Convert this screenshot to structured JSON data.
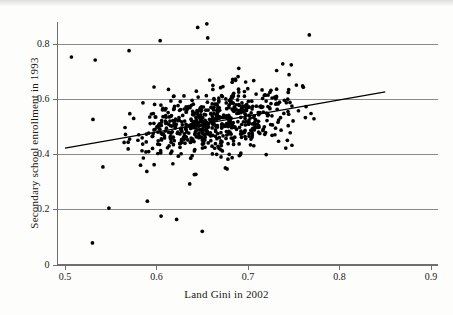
{
  "chart_data": {
    "type": "scatter",
    "title": "",
    "xlabel": "Land Gini in 2002",
    "ylabel": "Secondary school enrollment in 1993",
    "xlim": [
      0.5,
      0.9
    ],
    "ylim": [
      0.0,
      0.9
    ],
    "xticks": [
      0.5,
      0.6,
      0.7,
      0.8,
      0.9
    ],
    "xtick_labels": [
      "0.5",
      "0.6",
      "0.7",
      "0.8",
      "0.9"
    ],
    "yticks": [
      0.0,
      0.2,
      0.4,
      0.6,
      0.8
    ],
    "ytick_labels": [
      "0",
      "0.2",
      "0.4",
      "0.6",
      "0.8"
    ],
    "grid": "horizontal",
    "grid_color": "#8a8a8a",
    "axis_color": "#6f6f6f",
    "point_color": "#000000",
    "point_size": 2.6,
    "legend": "none",
    "fit_line": {
      "name": "linear fit",
      "color": "#000000",
      "x_start": 0.5,
      "y_start": 0.423,
      "x_end": 0.85,
      "y_end": 0.627,
      "slope": 0.583,
      "intercept": 0.1315
    },
    "series": [
      {
        "name": "countries",
        "n_points": 640,
        "x": [
          0.5,
          0.501,
          0.502,
          0.503,
          0.504,
          0.505,
          0.506,
          0.507,
          0.508,
          0.509,
          0.51,
          0.511,
          0.512,
          0.513,
          0.514,
          0.515,
          0.516,
          0.518,
          0.519,
          0.52,
          0.521,
          0.522,
          0.523,
          0.524,
          0.525,
          0.526,
          0.527,
          0.528,
          0.529,
          0.53,
          0.531,
          0.532,
          0.533,
          0.534,
          0.535,
          0.536,
          0.537,
          0.538,
          0.539,
          0.54,
          0.541,
          0.542,
          0.543,
          0.544,
          0.545,
          0.546,
          0.547,
          0.548,
          0.549,
          0.55,
          0.551,
          0.552,
          0.553,
          0.554,
          0.555,
          0.556,
          0.557,
          0.558,
          0.559,
          0.56,
          0.561,
          0.562,
          0.563,
          0.564,
          0.565,
          0.566,
          0.567,
          0.568,
          0.569,
          0.57,
          0.571,
          0.572,
          0.573,
          0.574,
          0.575,
          0.576,
          0.577,
          0.578,
          0.579,
          0.58,
          0.581,
          0.582,
          0.583,
          0.584,
          0.585,
          0.586,
          0.587,
          0.588,
          0.589,
          0.59,
          0.591,
          0.592,
          0.593,
          0.594,
          0.595,
          0.596,
          0.597,
          0.598,
          0.599,
          0.6,
          0.601,
          0.602,
          0.603,
          0.604,
          0.605,
          0.606,
          0.607,
          0.608,
          0.609,
          0.61,
          0.611,
          0.612,
          0.613,
          0.614,
          0.615,
          0.616,
          0.617,
          0.618,
          0.619,
          0.62,
          0.621,
          0.622,
          0.623,
          0.624,
          0.625,
          0.626,
          0.627,
          0.628,
          0.629,
          0.63,
          0.631,
          0.632,
          0.633,
          0.634,
          0.635,
          0.636,
          0.637,
          0.638,
          0.639,
          0.64,
          0.641,
          0.642,
          0.643,
          0.644,
          0.645,
          0.646,
          0.647,
          0.648,
          0.649,
          0.65,
          0.651,
          0.652,
          0.653,
          0.654,
          0.655,
          0.656,
          0.657,
          0.658,
          0.659,
          0.66,
          0.661,
          0.662,
          0.663,
          0.664,
          0.665,
          0.666,
          0.667,
          0.668,
          0.669,
          0.67,
          0.671,
          0.672,
          0.673,
          0.674,
          0.675,
          0.676,
          0.677,
          0.678,
          0.679,
          0.68,
          0.681,
          0.682,
          0.683,
          0.684,
          0.685,
          0.686,
          0.687,
          0.688,
          0.689,
          0.69,
          0.691,
          0.692,
          0.693,
          0.694,
          0.695,
          0.696,
          0.697,
          0.698,
          0.699,
          0.7,
          0.701,
          0.702,
          0.703,
          0.704,
          0.705,
          0.706,
          0.707,
          0.708,
          0.709,
          0.71,
          0.711,
          0.712,
          0.713,
          0.714,
          0.715,
          0.716,
          0.717,
          0.718,
          0.719,
          0.72,
          0.721,
          0.722,
          0.723,
          0.724,
          0.725,
          0.726,
          0.727,
          0.728,
          0.729,
          0.73,
          0.731,
          0.732,
          0.733,
          0.734,
          0.735,
          0.736,
          0.737,
          0.738,
          0.739,
          0.74,
          0.741,
          0.742,
          0.743,
          0.744,
          0.745,
          0.746,
          0.747,
          0.748,
          0.749,
          0.75,
          0.751,
          0.752,
          0.753,
          0.754,
          0.755,
          0.756,
          0.757,
          0.758,
          0.759,
          0.76,
          0.761,
          0.762,
          0.763,
          0.764,
          0.765,
          0.766,
          0.767,
          0.768,
          0.769,
          0.77,
          0.771,
          0.772,
          0.773,
          0.774,
          0.775,
          0.776,
          0.777,
          0.778,
          0.779,
          0.78,
          0.781,
          0.782,
          0.783,
          0.784,
          0.785,
          0.786,
          0.787,
          0.788,
          0.789,
          0.79,
          0.791,
          0.792,
          0.793,
          0.794,
          0.795,
          0.796,
          0.797,
          0.798,
          0.799,
          0.8,
          0.801,
          0.802,
          0.803,
          0.804,
          0.805,
          0.806,
          0.807,
          0.808,
          0.809,
          0.81,
          0.811,
          0.812,
          0.813,
          0.814,
          0.815,
          0.816,
          0.817,
          0.818,
          0.819,
          0.82,
          0.821,
          0.822,
          0.823,
          0.825,
          0.827,
          0.829,
          0.831,
          0.833,
          0.835,
          0.837,
          0.839,
          0.841,
          0.843,
          0.845,
          0.847,
          0.849
        ],
        "note": "x values are a representative sweep; full per-point cloud is generated deterministically in the template from the fitted trend plus scatter"
      }
    ],
    "outliers": [
      {
        "x": 0.53,
        "y": 0.08
      },
      {
        "x": 0.605,
        "y": 0.177
      },
      {
        "x": 0.622,
        "y": 0.165
      },
      {
        "x": 0.65,
        "y": 0.122
      },
      {
        "x": 0.59,
        "y": 0.231
      },
      {
        "x": 0.548,
        "y": 0.206
      },
      {
        "x": 0.655,
        "y": 0.873
      },
      {
        "x": 0.645,
        "y": 0.86
      },
      {
        "x": 0.656,
        "y": 0.822
      },
      {
        "x": 0.767,
        "y": 0.833
      },
      {
        "x": 0.57,
        "y": 0.776
      },
      {
        "x": 0.604,
        "y": 0.812
      },
      {
        "x": 0.507,
        "y": 0.753
      },
      {
        "x": 0.533,
        "y": 0.742
      }
    ],
    "cloud": {
      "n": 640,
      "x_min": 0.5,
      "x_max": 0.852,
      "y_center_slope": 0.583,
      "y_center_intercept": 0.1315,
      "y_spread": 0.105,
      "y_clip_min": 0.075,
      "y_clip_max": 0.875,
      "x_mode": 0.665,
      "seed": 20021993
    }
  },
  "figure": {
    "background": "#fdfdfc",
    "scan_band": true
  }
}
